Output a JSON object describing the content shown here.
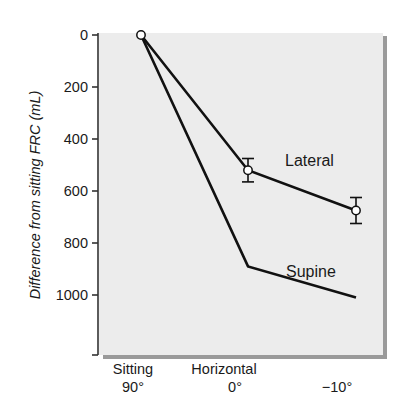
{
  "chart_data": {
    "type": "line",
    "title": "",
    "xlabel": "",
    "ylabel": "Difference from sitting FRC (mL)",
    "ylim": [
      0,
      1200
    ],
    "y_inverted": true,
    "yticks": [
      0,
      200,
      400,
      600,
      800,
      1000
    ],
    "categories": [
      {
        "line1": "Sitting",
        "line2": "90°"
      },
      {
        "line1": "Horizontal",
        "line2": "0°"
      },
      {
        "line1": "",
        "line2": "−10°"
      }
    ],
    "grid": false,
    "legend": "inline labels",
    "series": [
      {
        "name": "Lateral",
        "values": [
          0,
          520,
          675
        ],
        "error": [
          null,
          45,
          50
        ],
        "markers": "open-circle"
      },
      {
        "name": "Supine",
        "values": [
          0,
          890,
          1010
        ],
        "markers": "none"
      }
    ],
    "colors": {
      "plot_background": "#ececec",
      "line": "#111111",
      "shadow": "#9a9a9a"
    }
  }
}
